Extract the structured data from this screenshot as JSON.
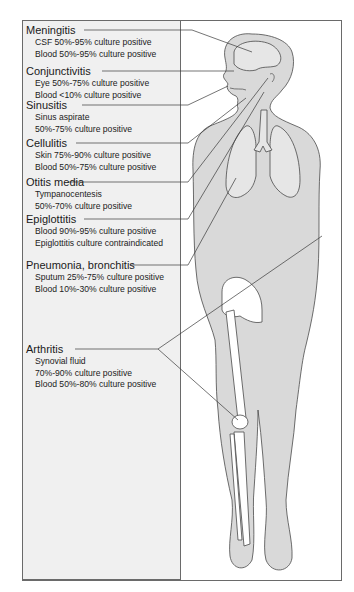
{
  "figure": {
    "entries": [
      {
        "title": "Meningitis",
        "lines": [
          "CSF 50%-95% culture positive",
          "Blood 50%-95% culture positive"
        ]
      },
      {
        "title": "Conjunctivitis",
        "lines": [
          "Eye 50%-75% culture positive",
          "Blood <10% culture positive"
        ]
      },
      {
        "title": "Sinusitis",
        "lines": [
          "Sinus aspirate",
          "50%-75% culture positive"
        ]
      },
      {
        "title": "Cellulitis",
        "lines": [
          "Skin 75%-90% culture positive",
          "Blood 50%-75% culture positive"
        ]
      },
      {
        "title": "Otitis media",
        "lines": [
          "Tympanocentesis",
          "50%-70% culture positive"
        ]
      },
      {
        "title": "Epiglottitis",
        "lines": [
          "Blood 90%-95% culture positive",
          "Epiglottitis culture contraindicated"
        ]
      },
      {
        "title": "Pneumonia, bronchitis",
        "lines": [
          "Sputum 25%-75% culture positive",
          "Blood 10%-30% culture positive"
        ]
      },
      {
        "title": "Arthritis",
        "lines": [
          "Synovial fluid",
          "70%-90% culture positive",
          "Blood 50%-80% culture positive"
        ]
      }
    ]
  },
  "colors": {
    "panel_bg": "#f0f0f0",
    "body_fill": "#d9d9d9",
    "bone_fill": "#ffffff",
    "outline": "#4a4a4a"
  }
}
